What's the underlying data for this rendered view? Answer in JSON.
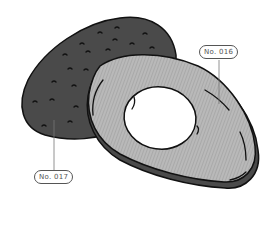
{
  "illustration": {
    "subject": "avocado halves",
    "colors": {
      "skin": "#4a4a4a",
      "flesh": "#b8b8b8",
      "pit_hole": "#ffffff",
      "outline": "#111111"
    }
  },
  "labels": [
    {
      "id": "label-016",
      "text": "No. 016"
    },
    {
      "id": "label-017",
      "text": "No. 017"
    }
  ]
}
